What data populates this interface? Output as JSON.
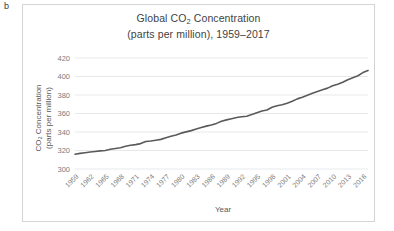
{
  "panel": {
    "label": "b"
  },
  "chart_data": {
    "type": "line",
    "subtitle": "(parts per million), 1959–2017",
    "title_line1": "Global CO",
    "title_line1_sub": "2",
    "title_line1_rest": " Concentration",
    "title_line2": "(parts per million), 1959–2017",
    "xlabel": "Year",
    "ylabel_line1": "CO₂ Concentration",
    "ylabel_line2": "(parts per million)",
    "ylabel_line1_pre": "CO",
    "ylabel_line1_sub": "2",
    "ylabel_line1_post": " Concentration",
    "grid": true,
    "legend": "none",
    "ylim": [
      300,
      420
    ],
    "yticks": [
      300,
      320,
      340,
      360,
      380,
      400,
      420
    ],
    "ytick_labels": [
      "300",
      "320",
      "340",
      "360",
      "380",
      "400",
      "420"
    ],
    "xlim": [
      1959,
      2017
    ],
    "xticks": [
      1959,
      1962,
      1965,
      1968,
      1971,
      1974,
      1977,
      1980,
      1983,
      1986,
      1989,
      1992,
      1995,
      1998,
      2001,
      2004,
      2007,
      2010,
      2013,
      2016
    ],
    "xtick_labels": [
      "1959",
      "1962",
      "1965",
      "1968",
      "1971",
      "1974",
      "1977",
      "1980",
      "1983",
      "1986",
      "1989",
      "1992",
      "1995",
      "1998",
      "2001",
      "2004",
      "2007",
      "2010",
      "2013",
      "2016"
    ],
    "x": [
      1959,
      1960,
      1961,
      1962,
      1963,
      1964,
      1965,
      1966,
      1967,
      1968,
      1969,
      1970,
      1971,
      1972,
      1973,
      1974,
      1975,
      1976,
      1977,
      1978,
      1979,
      1980,
      1981,
      1982,
      1983,
      1984,
      1985,
      1986,
      1987,
      1988,
      1989,
      1990,
      1991,
      1992,
      1993,
      1994,
      1995,
      1996,
      1997,
      1998,
      1999,
      2000,
      2001,
      2002,
      2003,
      2004,
      2005,
      2006,
      2007,
      2008,
      2009,
      2010,
      2011,
      2012,
      2013,
      2014,
      2015,
      2016,
      2017
    ],
    "values": [
      315.98,
      316.91,
      317.64,
      318.45,
      318.99,
      319.62,
      320.04,
      321.37,
      322.18,
      323.05,
      324.62,
      325.68,
      326.32,
      327.46,
      329.68,
      330.19,
      331.12,
      332.03,
      333.84,
      335.41,
      336.84,
      338.76,
      340.12,
      341.48,
      343.15,
      344.85,
      346.35,
      347.61,
      349.31,
      351.69,
      353.12,
      354.39,
      355.61,
      356.45,
      357.1,
      358.83,
      360.82,
      362.61,
      363.73,
      366.7,
      368.38,
      369.55,
      371.14,
      373.28,
      375.8,
      377.52,
      379.8,
      381.9,
      383.79,
      385.6,
      387.43,
      389.9,
      391.65,
      393.85,
      396.52,
      398.65,
      400.83,
      404.24,
      406.55
    ]
  }
}
